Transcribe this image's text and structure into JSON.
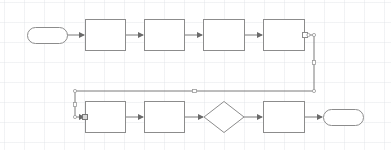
{
  "diagram": {
    "type": "flowchart",
    "colors": {
      "stroke": "#8c8c8c",
      "edge": "#7a7a7a",
      "fill": "#ffffff",
      "grid": "#e1e4e8",
      "handle": "#999999"
    },
    "nodes": [
      {
        "id": "start",
        "shape": "terminator",
        "label": ""
      },
      {
        "id": "p1",
        "shape": "process",
        "label": ""
      },
      {
        "id": "p2",
        "shape": "process",
        "label": ""
      },
      {
        "id": "p3",
        "shape": "process",
        "label": ""
      },
      {
        "id": "p4",
        "shape": "process",
        "label": ""
      },
      {
        "id": "p5",
        "shape": "process",
        "label": ""
      },
      {
        "id": "p6",
        "shape": "process",
        "label": ""
      },
      {
        "id": "d1",
        "shape": "decision",
        "label": ""
      },
      {
        "id": "p7",
        "shape": "process",
        "label": ""
      },
      {
        "id": "end",
        "shape": "terminator",
        "label": ""
      }
    ],
    "edges": [
      {
        "from": "start",
        "to": "p1"
      },
      {
        "from": "p1",
        "to": "p2"
      },
      {
        "from": "p2",
        "to": "p3"
      },
      {
        "from": "p3",
        "to": "p4"
      },
      {
        "from": "p4",
        "to": "p5",
        "routing": "orthogonal",
        "selected": true
      },
      {
        "from": "p5",
        "to": "p6"
      },
      {
        "from": "p6",
        "to": "d1"
      },
      {
        "from": "d1",
        "to": "p7"
      },
      {
        "from": "p7",
        "to": "end"
      }
    ]
  }
}
